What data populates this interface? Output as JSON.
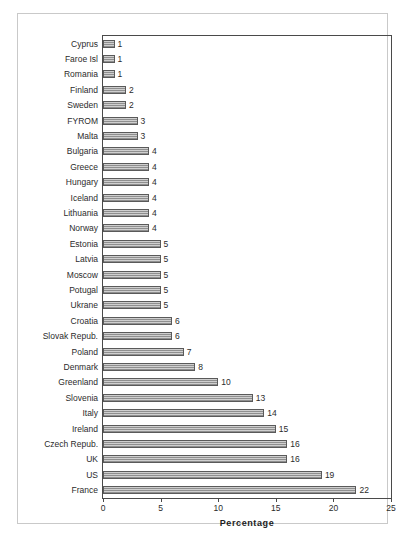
{
  "chart_data": {
    "type": "bar",
    "orientation": "horizontal",
    "title": "",
    "xlabel": "Percentage",
    "ylabel": "",
    "xlim": [
      0,
      25
    ],
    "xticks": [
      0,
      5,
      10,
      15,
      20,
      25
    ],
    "xtick_labels": [
      "0",
      "5",
      "10",
      "15",
      "20",
      "25"
    ],
    "grid": false,
    "legend": null,
    "data_labels": true,
    "categories": [
      "Cyprus",
      "Faroe Isl",
      "Romania",
      "Finland",
      "Sweden",
      "FYROM",
      "Malta",
      "Bulgaria",
      "Greece",
      "Hungary",
      "Iceland",
      "Lithuania",
      "Norway",
      "Estonia",
      "Latvia",
      "Moscow",
      "Potugal",
      "Ukrane",
      "Croatia",
      "Slovak Repub.",
      "Poland",
      "Denmark",
      "Greenland",
      "Slovenia",
      "Italy",
      "Ireland",
      "Czech Repub.",
      "UK",
      "US",
      "France"
    ],
    "values": [
      1,
      1,
      1,
      2,
      2,
      3,
      3,
      4,
      4,
      4,
      4,
      4,
      4,
      5,
      5,
      5,
      5,
      5,
      6,
      6,
      7,
      8,
      10,
      13,
      14,
      15,
      16,
      16,
      19,
      22
    ],
    "value_labels": [
      "1",
      "1",
      "1",
      "2",
      "2",
      "3",
      "3",
      "4",
      "4",
      "4",
      "4",
      "4",
      "4",
      "5",
      "5",
      "5",
      "5",
      "5",
      "6",
      "6",
      "7",
      "8",
      "10",
      "13",
      "14",
      "15",
      "16",
      "16",
      "19",
      "22"
    ],
    "colors": {
      "bar_fill": "#b4b4b4",
      "bar_edge": "#5a5a5a",
      "axis": "#4a4a4a",
      "text": "#2b2b2b",
      "frame": "#c9c9c9",
      "background": "#ffffff"
    }
  }
}
